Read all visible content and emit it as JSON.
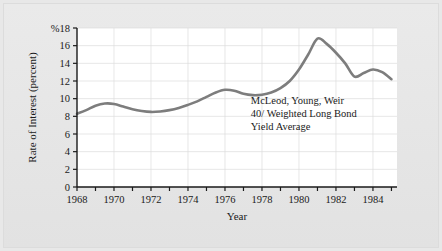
{
  "figure": {
    "background_color": "#e8e8e8",
    "plot_background_color": "#ffffff"
  },
  "chart_data": {
    "type": "line",
    "title": "",
    "subtitle": "",
    "xlabel": "Year",
    "ylabel": "Rate of Interest (percent)",
    "y_top_label": "%18",
    "xlim": [
      1968,
      1985.3
    ],
    "ylim": [
      0,
      18
    ],
    "grid": true,
    "legend_position": "none",
    "line_color": "#7d7d7d",
    "line_width": 2.6,
    "y_ticks": [
      0,
      2,
      4,
      6,
      8,
      10,
      12,
      14,
      16,
      18
    ],
    "y_tick_labels": [
      "0",
      "2",
      "4",
      "6",
      "8",
      "10",
      "12",
      "14",
      "16",
      "%18"
    ],
    "x_ticks": [
      1968,
      1969,
      1970,
      1971,
      1972,
      1973,
      1974,
      1975,
      1976,
      1977,
      1978,
      1979,
      1980,
      1981,
      1982,
      1983,
      1984,
      1985
    ],
    "x_tick_labels_shown": [
      "1968",
      "1970",
      "1972",
      "1974",
      "1976",
      "1978",
      "1980",
      "1982",
      "1984"
    ],
    "x_tick_labels_values": [
      1968,
      1970,
      1972,
      1974,
      1976,
      1978,
      1980,
      1982,
      1984
    ],
    "series": [
      {
        "name": "McLeod, Young, Weir 40/ Weighted Long Bond Yield Average",
        "x": [
          1968,
          1968.5,
          1969,
          1969.5,
          1970,
          1970.5,
          1971,
          1971.5,
          1972,
          1972.5,
          1973,
          1973.5,
          1974,
          1974.5,
          1975,
          1975.5,
          1976,
          1976.5,
          1977,
          1977.5,
          1978,
          1978.5,
          1979,
          1979.5,
          1980,
          1980.5,
          1981,
          1981.5,
          1982,
          1982.5,
          1983,
          1983.5,
          1984,
          1984.5,
          1985
        ],
        "values": [
          8.3,
          8.7,
          9.2,
          9.45,
          9.4,
          9.1,
          8.8,
          8.6,
          8.5,
          8.55,
          8.7,
          8.95,
          9.3,
          9.7,
          10.2,
          10.7,
          11.0,
          10.9,
          10.55,
          10.4,
          10.45,
          10.7,
          11.2,
          12.0,
          13.3,
          15.0,
          16.8,
          16.2,
          15.2,
          14.0,
          12.5,
          12.9,
          13.3,
          13.0,
          12.2
        ]
      }
    ],
    "annotations": [
      {
        "name": "series-annotation",
        "lines": [
          "McLeod, Young, Weir",
          "40/ Weighted Long Bond",
          "Yield Average"
        ],
        "x": 1977.4,
        "y": 9.4
      }
    ]
  }
}
